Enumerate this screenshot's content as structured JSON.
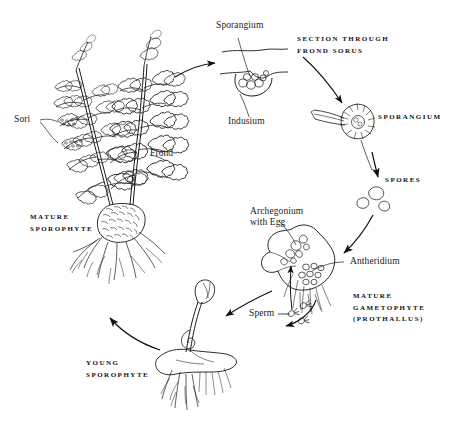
{
  "figure": {
    "background_color": "#ffffff",
    "ink_color": "#1a1a1a"
  },
  "labels": {
    "sori": "Sori",
    "frond": "Frond",
    "sporangium_top": "Sporangium",
    "indusium": "Indusium",
    "archegonium": "Archegonium\nwith Egg",
    "antheridium": "Antheridium",
    "sperm": "Sperm"
  },
  "captions": {
    "mature_sporophyte": "MATURE\nSPOROPHYTE",
    "section_through": "SECTION THROUGH\nFROND SORUS",
    "sporangium": "SPORANGIUM",
    "spores": "SPORES",
    "mature_gametophyte": "MATURE\nGAMETOPHYTE\n(PROTHALLUS)",
    "young_sporophyte": "YOUNG\nSPOROPHYTE"
  },
  "stages": [
    {
      "name": "mature-sporophyte",
      "caption": "MATURE SPOROPHYTE"
    },
    {
      "name": "frond-sorus-section",
      "caption": "SECTION THROUGH FROND SORUS"
    },
    {
      "name": "sporangium",
      "caption": "SPORANGIUM"
    },
    {
      "name": "spores",
      "caption": "SPORES"
    },
    {
      "name": "mature-gametophyte",
      "caption": "MATURE GAMETOPHYTE (PROTHALLUS)"
    },
    {
      "name": "young-sporophyte",
      "caption": "YOUNG SPOROPHYTE"
    }
  ]
}
